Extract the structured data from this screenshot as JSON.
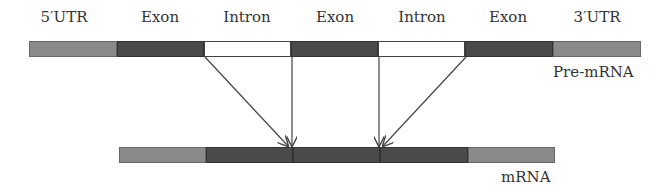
{
  "diagram": {
    "title": "",
    "pre_mrna": {
      "label": "Pre-mRNA",
      "segments": [
        {
          "label": "5′UTR",
          "type": "utr",
          "x": 29,
          "w": 88
        },
        {
          "label": "Exon",
          "type": "exon",
          "x": 117,
          "w": 87
        },
        {
          "label": "Intron",
          "type": "intron",
          "x": 204,
          "w": 87
        },
        {
          "label": "Exon",
          "type": "exon",
          "x": 291,
          "w": 87
        },
        {
          "label": "Intron",
          "type": "intron",
          "x": 378,
          "w": 87
        },
        {
          "label": "Exon",
          "type": "exon",
          "x": 465,
          "w": 88
        },
        {
          "label": "3′UTR",
          "type": "utr",
          "x": 553,
          "w": 88
        }
      ]
    },
    "mrna": {
      "label": "mRNA",
      "segments": [
        {
          "type": "utr",
          "x": 119,
          "w": 87
        },
        {
          "type": "exon",
          "x": 206,
          "w": 87
        },
        {
          "type": "exon",
          "x": 293,
          "w": 87
        },
        {
          "type": "exon",
          "x": 380,
          "w": 88
        },
        {
          "type": "utr",
          "x": 468,
          "w": 87
        }
      ]
    },
    "colors": {
      "utr": "#8a8a8a",
      "exon": "#4a4a4a",
      "intron": "#ffffff",
      "line": "#444444"
    }
  }
}
